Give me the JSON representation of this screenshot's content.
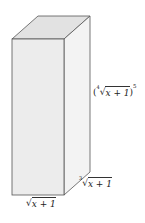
{
  "diagram": {
    "type": "rectangular-prism",
    "colors": {
      "front_face": "#ececec",
      "top_face": "#e2e2e2",
      "side_face": "#f3f3f3",
      "edge": "#555555"
    },
    "labels": {
      "width": {
        "index": "",
        "radicand": "x + 1",
        "power": ""
      },
      "depth": {
        "index": "3",
        "radicand": "x + 1",
        "power": ""
      },
      "height": {
        "open": "(",
        "index": "4",
        "radicand": "x + 1",
        "close": ")",
        "power": "5"
      }
    },
    "radical_sign": "√"
  }
}
